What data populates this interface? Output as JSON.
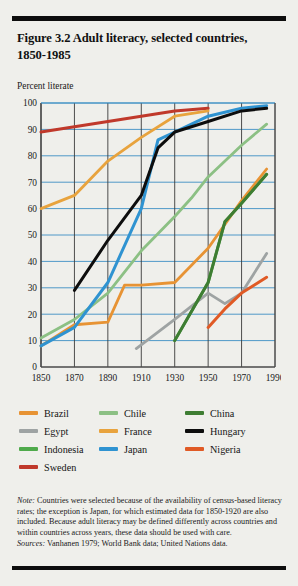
{
  "figure": {
    "title": "Figure 3.2  Adult literacy, selected countries, 1850-1985",
    "title_line1": "Figure 3.2  Adult literacy, selected countries,",
    "title_line2": "1850-1985",
    "axis_caption": "Percent literate",
    "note_label": "Note:",
    "note_body": " Countries were selected because of the availability of census-based literacy rates; the exception is Japan, for which estimated data for 1850-1920 are also included. Because adult literacy may be defined differently across countries and within countries across years, these data should be used with care.",
    "sources_label": "Sources:",
    "sources_body": " Vanhanen 1979; World Bank data; United Nations data."
  },
  "legend": {
    "rows": [
      [
        {
          "label": "Brazil",
          "color": "#e79334"
        },
        {
          "label": "Chile",
          "color": "#8cc084"
        },
        {
          "label": "China",
          "color": "#3e7d32"
        }
      ],
      [
        {
          "label": "Egypt",
          "color": "#9ea3a3"
        },
        {
          "label": "France",
          "color": "#e8a33d"
        },
        {
          "label": "Hungary",
          "color": "#0d0d0d"
        }
      ],
      [
        {
          "label": "Indonesia",
          "color": "#4faa4b"
        },
        {
          "label": "Japan",
          "color": "#2f93d1"
        },
        {
          "label": "Nigeria",
          "color": "#e05a25"
        }
      ],
      [
        {
          "label": "Sweden",
          "color": "#c0392b"
        }
      ]
    ]
  },
  "chart_data": {
    "type": "line",
    "title": "Figure 3.2  Adult literacy, selected countries, 1850-1985",
    "xlabel": "",
    "ylabel": "Percent literate",
    "xlim": [
      1850,
      1990
    ],
    "ylim": [
      0,
      100
    ],
    "xticks": [
      1850,
      1870,
      1890,
      1910,
      1930,
      1950,
      1970,
      1990
    ],
    "yticks": [
      0,
      10,
      20,
      30,
      40,
      50,
      60,
      70,
      80,
      90,
      100
    ],
    "grid": "horizontal-and-vertical",
    "legend_position": "below",
    "series": [
      {
        "name": "Sweden",
        "color": "#c0392b",
        "x": [
          1850,
          1870,
          1890,
          1910,
          1930,
          1950
        ],
        "values": [
          89,
          91,
          93,
          95,
          97,
          98
        ]
      },
      {
        "name": "France",
        "color": "#e8a33d",
        "x": [
          1850,
          1870,
          1890,
          1910,
          1930,
          1950
        ],
        "values": [
          60,
          65,
          78,
          87,
          95,
          97
        ]
      },
      {
        "name": "Hungary",
        "color": "#0d0d0d",
        "x": [
          1870,
          1890,
          1910,
          1920,
          1930,
          1950,
          1970,
          1985
        ],
        "values": [
          29,
          48,
          65,
          83,
          89,
          93,
          97,
          98
        ]
      },
      {
        "name": "Japan",
        "color": "#2f93d1",
        "x": [
          1850,
          1870,
          1890,
          1910,
          1920,
          1930,
          1950,
          1970,
          1985
        ],
        "values": [
          8,
          15,
          32,
          60,
          86,
          89,
          95,
          98,
          99
        ]
      },
      {
        "name": "Chile",
        "color": "#8cc084",
        "x": [
          1850,
          1870,
          1890,
          1910,
          1930,
          1940,
          1950,
          1970,
          1985
        ],
        "values": [
          11,
          18,
          28,
          44,
          57,
          64,
          72,
          84,
          92
        ]
      },
      {
        "name": "Brazil",
        "color": "#e79334",
        "x": [
          1850,
          1870,
          1890,
          1900,
          1910,
          1930,
          1950,
          1970,
          1985
        ],
        "values": [
          8,
          16,
          17,
          31,
          31,
          32,
          45,
          63,
          75
        ]
      },
      {
        "name": "China",
        "color": "#3e7d32",
        "x": [
          1930,
          1950,
          1960,
          1970,
          1985
        ],
        "values": [
          10,
          32,
          55,
          62,
          73
        ]
      },
      {
        "name": "Egypt",
        "color": "#9ea3a3",
        "x": [
          1907,
          1930,
          1950,
          1960,
          1970,
          1985
        ],
        "values": [
          7,
          18,
          28,
          24,
          28,
          43
        ]
      },
      {
        "name": "Nigeria",
        "color": "#e05a25",
        "x": [
          1950,
          1960,
          1970,
          1985
        ],
        "values": [
          15,
          22,
          28,
          34
        ]
      },
      {
        "name": "Indonesia",
        "color": "#4faa4b",
        "x": [
          1930,
          1950,
          1960,
          1970,
          1985
        ],
        "values": [
          10,
          32,
          55,
          62,
          73
        ]
      }
    ]
  }
}
